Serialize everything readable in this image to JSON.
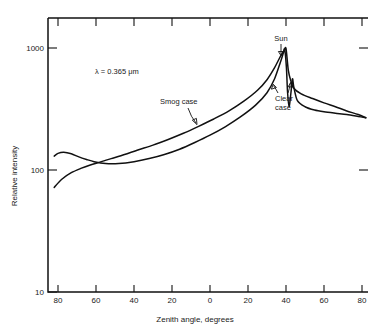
{
  "chart_data": {
    "type": "line",
    "title": "",
    "xlabel": "Zenith angle, degrees",
    "ylabel": "Relative intensity",
    "yscale": "log",
    "ylim": [
      10,
      1000
    ],
    "ytick_labels": [
      "1000",
      "100",
      "10"
    ],
    "ytick_values": [
      1000,
      100,
      10
    ],
    "xlim": [
      -90,
      90
    ],
    "xtick_labels": [
      "80",
      "60",
      "40",
      "20",
      "0",
      "20",
      "40",
      "60",
      "80"
    ],
    "xtick_values": [
      -80,
      -60,
      -40,
      -20,
      0,
      20,
      40,
      60,
      80
    ],
    "grid": false,
    "legend": "inline-annotations",
    "annotations": [
      {
        "name": "wavelength",
        "text": "λ = 0.365 μm"
      },
      {
        "name": "sun-label",
        "text": "Sun"
      },
      {
        "name": "smog-label",
        "text": "Smog case"
      },
      {
        "name": "clear-label-line1",
        "text": "Clear"
      },
      {
        "name": "clear-label-line2",
        "text": "case"
      }
    ],
    "series": [
      {
        "name": "Smog case",
        "points": [
          [
            -82,
            130
          ],
          [
            -80,
            137
          ],
          [
            -77,
            140
          ],
          [
            -73,
            136
          ],
          [
            -69,
            128
          ],
          [
            -65,
            122
          ],
          [
            -61,
            117
          ],
          [
            -55,
            113
          ],
          [
            -48,
            113
          ],
          [
            -40,
            117
          ],
          [
            -32,
            124
          ],
          [
            -24,
            134
          ],
          [
            -16,
            148
          ],
          [
            -8,
            168
          ],
          [
            0,
            193
          ],
          [
            8,
            226
          ],
          [
            16,
            272
          ],
          [
            24,
            340
          ],
          [
            30,
            430
          ],
          [
            34,
            560
          ],
          [
            37,
            760
          ],
          [
            38.5,
            900
          ],
          [
            39.3,
            980
          ],
          [
            40.2,
            700
          ],
          [
            40.8,
            440
          ],
          [
            41.6,
            330
          ],
          [
            42.6,
            430
          ],
          [
            43.4,
            560
          ],
          [
            44.1,
            480
          ],
          [
            46,
            370
          ],
          [
            50,
            330
          ],
          [
            55,
            310
          ],
          [
            60,
            300
          ],
          [
            66,
            292
          ],
          [
            72,
            285
          ],
          [
            78,
            275
          ],
          [
            82,
            268
          ]
        ]
      },
      {
        "name": "Clear case",
        "points": [
          [
            -82,
            72
          ],
          [
            -78,
            84
          ],
          [
            -73,
            95
          ],
          [
            -68,
            103
          ],
          [
            -63,
            110
          ],
          [
            -58,
            116
          ],
          [
            -52,
            124
          ],
          [
            -45,
            134
          ],
          [
            -38,
            146
          ],
          [
            -30,
            160
          ],
          [
            -22,
            178
          ],
          [
            -14,
            200
          ],
          [
            -6,
            228
          ],
          [
            2,
            262
          ],
          [
            10,
            305
          ],
          [
            18,
            368
          ],
          [
            25,
            450
          ],
          [
            30,
            550
          ],
          [
            34,
            690
          ],
          [
            37,
            850
          ],
          [
            39,
            950
          ],
          [
            40,
            990
          ],
          [
            41.2,
            660
          ],
          [
            42.5,
            540
          ],
          [
            44,
            470
          ],
          [
            48,
            420
          ],
          [
            54,
            385
          ],
          [
            60,
            355
          ],
          [
            66,
            330
          ],
          [
            72,
            305
          ],
          [
            78,
            285
          ],
          [
            82,
            268
          ]
        ]
      }
    ]
  }
}
